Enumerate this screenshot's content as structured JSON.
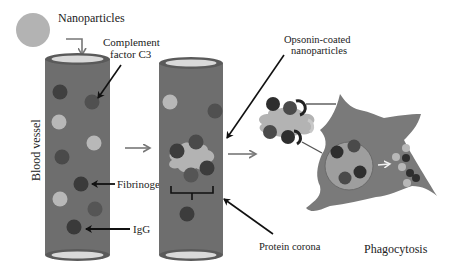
{
  "labels": {
    "nanoparticles": "Nanoparticles",
    "complement_line1": "Complement",
    "complement_line2": "factor C3",
    "blood_vessel": "Blood vessel",
    "fibrinogen": "Fibrinogen",
    "igg": "IgG",
    "opsonin_line1": "Opsonin-coated",
    "opsonin_line2": "nanoparticles",
    "protein_corona": "Protein corona",
    "phagocytosis": "Phagocytosis"
  },
  "colors": {
    "vessel": "#6e6e6e",
    "vessel_rim": "#5a5a5a",
    "vessel_opening": "#d9d9d9",
    "nanoparticle": "#b3b3b3",
    "protein_dark": "#3c3c3c",
    "protein_mid": "#555555",
    "cell": "#7a7a7a",
    "arrow": "#7a7a7a",
    "text": "#222222"
  }
}
